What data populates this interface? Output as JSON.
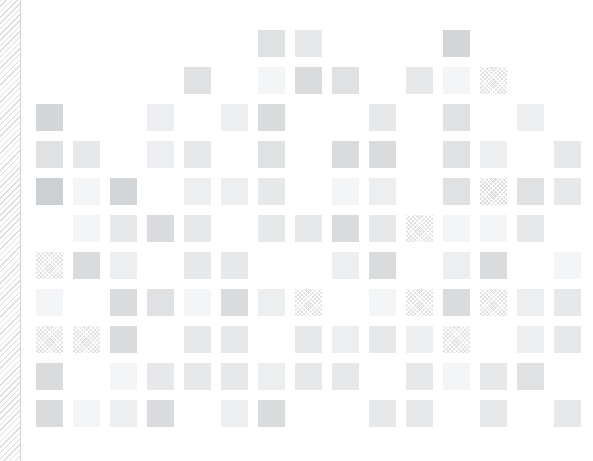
{
  "figure": {
    "title": "",
    "background_color": "#ffffff",
    "canvas_color": "#ffffff",
    "edge_band": {
      "name": "diagonal-stripe-band",
      "width_px": 21,
      "stripe_color": "#bcc0c4",
      "stripe_angle_deg": 135,
      "stripe_period_px": 4,
      "border_color": "#cfd3d6"
    }
  },
  "chart_data": {
    "type": "heatmap",
    "title": "",
    "xlabel": "",
    "ylabel": "",
    "grid": false,
    "legend": "none",
    "annotations": [],
    "cell_size_px": 27,
    "cell_pitch_px": 37,
    "origin_px": {
      "x": 15,
      "y": 30
    },
    "n_cols": 15,
    "n_rows": 11,
    "categories_x": [
      "c1",
      "c2",
      "c3",
      "c4",
      "c5",
      "c6",
      "c7",
      "c8",
      "c9",
      "c10",
      "c11",
      "c12",
      "c13",
      "c14",
      "c15"
    ],
    "categories_y": [
      "r1",
      "r2",
      "r3",
      "r4",
      "r5",
      "r6",
      "r7",
      "r8",
      "r9",
      "r10",
      "r11"
    ],
    "value_colors": {
      "empty": "#ffffff",
      "very_light": "#f4f5f6",
      "light": "#eceeef",
      "mid_light": "#e6e8e9",
      "mid": "#dfe1e3",
      "mid_dark": "#d9dbdd",
      "dark": "#d3d6d8",
      "darker": "#cdd0d3"
    },
    "texture_name": "cross-hatch",
    "cells": [
      {
        "r": 0,
        "c": 6,
        "v": "mid",
        "t": false
      },
      {
        "r": 0,
        "c": 7,
        "v": "mid_light",
        "t": false
      },
      {
        "r": 0,
        "c": 11,
        "v": "dark",
        "t": false
      },
      {
        "r": 1,
        "c": 4,
        "v": "mid",
        "t": false
      },
      {
        "r": 1,
        "c": 6,
        "v": "very_light",
        "t": false
      },
      {
        "r": 1,
        "c": 7,
        "v": "mid_dark",
        "t": false
      },
      {
        "r": 1,
        "c": 8,
        "v": "mid",
        "t": false
      },
      {
        "r": 1,
        "c": 10,
        "v": "mid_light",
        "t": false
      },
      {
        "r": 1,
        "c": 11,
        "v": "very_light",
        "t": false
      },
      {
        "r": 1,
        "c": 12,
        "v": "mid",
        "t": true
      },
      {
        "r": 2,
        "c": 0,
        "v": "dark",
        "t": false
      },
      {
        "r": 2,
        "c": 3,
        "v": "light",
        "t": false
      },
      {
        "r": 2,
        "c": 5,
        "v": "light",
        "t": false
      },
      {
        "r": 2,
        "c": 6,
        "v": "mid_dark",
        "t": false
      },
      {
        "r": 2,
        "c": 9,
        "v": "mid_light",
        "t": false
      },
      {
        "r": 2,
        "c": 11,
        "v": "mid",
        "t": false
      },
      {
        "r": 2,
        "c": 13,
        "v": "light",
        "t": false
      },
      {
        "r": 3,
        "c": 0,
        "v": "mid",
        "t": false
      },
      {
        "r": 3,
        "c": 1,
        "v": "mid_light",
        "t": false
      },
      {
        "r": 3,
        "c": 3,
        "v": "light",
        "t": false
      },
      {
        "r": 3,
        "c": 4,
        "v": "mid_light",
        "t": false
      },
      {
        "r": 3,
        "c": 6,
        "v": "mid",
        "t": false
      },
      {
        "r": 3,
        "c": 8,
        "v": "mid_dark",
        "t": false
      },
      {
        "r": 3,
        "c": 9,
        "v": "mid_dark",
        "t": false
      },
      {
        "r": 3,
        "c": 11,
        "v": "mid",
        "t": false
      },
      {
        "r": 3,
        "c": 12,
        "v": "light",
        "t": false
      },
      {
        "r": 3,
        "c": 14,
        "v": "mid_light",
        "t": false
      },
      {
        "r": 4,
        "c": 0,
        "v": "darker",
        "t": false
      },
      {
        "r": 4,
        "c": 1,
        "v": "very_light",
        "t": false
      },
      {
        "r": 4,
        "c": 2,
        "v": "dark",
        "t": false
      },
      {
        "r": 4,
        "c": 4,
        "v": "light",
        "t": false
      },
      {
        "r": 4,
        "c": 5,
        "v": "light",
        "t": false
      },
      {
        "r": 4,
        "c": 6,
        "v": "mid_light",
        "t": false
      },
      {
        "r": 4,
        "c": 8,
        "v": "very_light",
        "t": false
      },
      {
        "r": 4,
        "c": 9,
        "v": "light",
        "t": false
      },
      {
        "r": 4,
        "c": 11,
        "v": "mid",
        "t": false
      },
      {
        "r": 4,
        "c": 12,
        "v": "mid_dark",
        "t": true
      },
      {
        "r": 4,
        "c": 13,
        "v": "mid",
        "t": false
      },
      {
        "r": 4,
        "c": 14,
        "v": "mid_light",
        "t": false
      },
      {
        "r": 5,
        "c": 1,
        "v": "very_light",
        "t": false
      },
      {
        "r": 5,
        "c": 2,
        "v": "mid_light",
        "t": false
      },
      {
        "r": 5,
        "c": 3,
        "v": "mid_dark",
        "t": false
      },
      {
        "r": 5,
        "c": 4,
        "v": "mid_light",
        "t": false
      },
      {
        "r": 5,
        "c": 6,
        "v": "mid_light",
        "t": false
      },
      {
        "r": 5,
        "c": 7,
        "v": "mid_light",
        "t": false
      },
      {
        "r": 5,
        "c": 8,
        "v": "mid_dark",
        "t": false
      },
      {
        "r": 5,
        "c": 9,
        "v": "mid_light",
        "t": false
      },
      {
        "r": 5,
        "c": 10,
        "v": "mid",
        "t": true
      },
      {
        "r": 5,
        "c": 11,
        "v": "very_light",
        "t": false
      },
      {
        "r": 5,
        "c": 12,
        "v": "very_light",
        "t": false
      },
      {
        "r": 5,
        "c": 13,
        "v": "mid_light",
        "t": false
      },
      {
        "r": 6,
        "c": 0,
        "v": "mid",
        "t": true
      },
      {
        "r": 6,
        "c": 1,
        "v": "mid_dark",
        "t": false
      },
      {
        "r": 6,
        "c": 2,
        "v": "light",
        "t": false
      },
      {
        "r": 6,
        "c": 4,
        "v": "mid_light",
        "t": false
      },
      {
        "r": 6,
        "c": 5,
        "v": "mid_light",
        "t": false
      },
      {
        "r": 6,
        "c": 8,
        "v": "light",
        "t": false
      },
      {
        "r": 6,
        "c": 9,
        "v": "mid_dark",
        "t": false
      },
      {
        "r": 6,
        "c": 11,
        "v": "light",
        "t": false
      },
      {
        "r": 6,
        "c": 12,
        "v": "mid_dark",
        "t": false
      },
      {
        "r": 6,
        "c": 14,
        "v": "very_light",
        "t": false
      },
      {
        "r": 7,
        "c": 0,
        "v": "very_light",
        "t": false
      },
      {
        "r": 7,
        "c": 2,
        "v": "mid_dark",
        "t": false
      },
      {
        "r": 7,
        "c": 3,
        "v": "mid",
        "t": false
      },
      {
        "r": 7,
        "c": 4,
        "v": "very_light",
        "t": false
      },
      {
        "r": 7,
        "c": 5,
        "v": "mid_dark",
        "t": false
      },
      {
        "r": 7,
        "c": 6,
        "v": "light",
        "t": false
      },
      {
        "r": 7,
        "c": 7,
        "v": "mid",
        "t": true
      },
      {
        "r": 7,
        "c": 9,
        "v": "very_light",
        "t": false
      },
      {
        "r": 7,
        "c": 10,
        "v": "mid",
        "t": true
      },
      {
        "r": 7,
        "c": 11,
        "v": "mid_dark",
        "t": false
      },
      {
        "r": 7,
        "c": 12,
        "v": "mid",
        "t": true
      },
      {
        "r": 7,
        "c": 13,
        "v": "light",
        "t": false
      },
      {
        "r": 7,
        "c": 14,
        "v": "mid_light",
        "t": false
      },
      {
        "r": 8,
        "c": 0,
        "v": "mid",
        "t": true
      },
      {
        "r": 8,
        "c": 1,
        "v": "mid",
        "t": true
      },
      {
        "r": 8,
        "c": 2,
        "v": "mid_dark",
        "t": false
      },
      {
        "r": 8,
        "c": 4,
        "v": "mid_light",
        "t": false
      },
      {
        "r": 8,
        "c": 5,
        "v": "mid_light",
        "t": false
      },
      {
        "r": 8,
        "c": 7,
        "v": "mid_light",
        "t": false
      },
      {
        "r": 8,
        "c": 8,
        "v": "light",
        "t": false
      },
      {
        "r": 8,
        "c": 9,
        "v": "mid_light",
        "t": false
      },
      {
        "r": 8,
        "c": 10,
        "v": "light",
        "t": false
      },
      {
        "r": 8,
        "c": 11,
        "v": "mid",
        "t": true
      },
      {
        "r": 8,
        "c": 13,
        "v": "light",
        "t": false
      },
      {
        "r": 8,
        "c": 14,
        "v": "mid_light",
        "t": false
      },
      {
        "r": 9,
        "c": 0,
        "v": "mid_dark",
        "t": false
      },
      {
        "r": 9,
        "c": 2,
        "v": "very_light",
        "t": false
      },
      {
        "r": 9,
        "c": 3,
        "v": "mid_light",
        "t": false
      },
      {
        "r": 9,
        "c": 4,
        "v": "mid_light",
        "t": false
      },
      {
        "r": 9,
        "c": 5,
        "v": "mid_light",
        "t": false
      },
      {
        "r": 9,
        "c": 6,
        "v": "light",
        "t": false
      },
      {
        "r": 9,
        "c": 7,
        "v": "mid_light",
        "t": false
      },
      {
        "r": 9,
        "c": 8,
        "v": "mid_light",
        "t": false
      },
      {
        "r": 9,
        "c": 10,
        "v": "mid_light",
        "t": false
      },
      {
        "r": 9,
        "c": 11,
        "v": "very_light",
        "t": false
      },
      {
        "r": 9,
        "c": 12,
        "v": "mid_light",
        "t": false
      },
      {
        "r": 9,
        "c": 13,
        "v": "mid",
        "t": false
      },
      {
        "r": 10,
        "c": 0,
        "v": "mid_dark",
        "t": false
      },
      {
        "r": 10,
        "c": 1,
        "v": "very_light",
        "t": false
      },
      {
        "r": 10,
        "c": 2,
        "v": "light",
        "t": false
      },
      {
        "r": 10,
        "c": 3,
        "v": "mid_dark",
        "t": false
      },
      {
        "r": 10,
        "c": 5,
        "v": "light",
        "t": false
      },
      {
        "r": 10,
        "c": 6,
        "v": "mid_dark",
        "t": false
      },
      {
        "r": 10,
        "c": 9,
        "v": "mid_light",
        "t": false
      },
      {
        "r": 10,
        "c": 10,
        "v": "mid_light",
        "t": false
      },
      {
        "r": 10,
        "c": 12,
        "v": "mid_light",
        "t": false
      },
      {
        "r": 10,
        "c": 14,
        "v": "mid_light",
        "t": false
      }
    ]
  }
}
